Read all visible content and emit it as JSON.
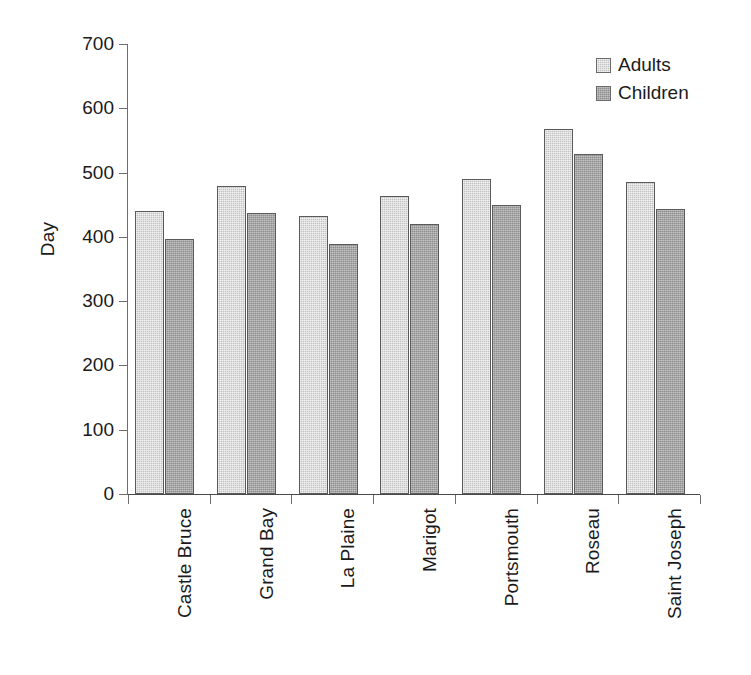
{
  "chart_data": {
    "type": "bar",
    "title": "",
    "xlabel": "",
    "ylabel": "Day",
    "ylim": [
      0,
      700
    ],
    "yticks": [
      0,
      100,
      200,
      300,
      400,
      500,
      600,
      700
    ],
    "grid": false,
    "legend_position": "top-right",
    "categories": [
      "Castle Bruce",
      "Grand Bay",
      "La Plaine",
      "Marigot",
      "Portsmouth",
      "Roseau",
      "Saint Joseph"
    ],
    "series": [
      {
        "name": "Adults",
        "color": "#c2c2c2",
        "values": [
          440,
          479,
          433,
          464,
          490,
          568,
          486
        ]
      },
      {
        "name": "Children",
        "color": "#8d8d8d",
        "values": [
          397,
          437,
          389,
          420,
          450,
          529,
          443
        ]
      }
    ]
  },
  "axis": {
    "y_title": "Day",
    "y_tick_labels": [
      "700",
      "600",
      "500",
      "400",
      "300",
      "200",
      "100",
      "0"
    ]
  },
  "legend": {
    "items": [
      {
        "label": "Adults",
        "swatch": "adults-swatch-icon"
      },
      {
        "label": "Children",
        "swatch": "children-swatch-icon"
      }
    ]
  },
  "colors": {
    "adults": "#c2c2c2",
    "children": "#8d8d8d",
    "axis": "#6e6e6e",
    "text": "#1a1a1a",
    "background": "#ffffff"
  }
}
